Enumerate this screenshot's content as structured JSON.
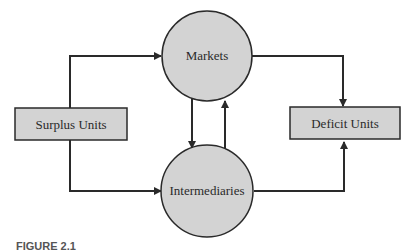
{
  "diagram": {
    "nodes": [
      {
        "id": "surplus",
        "label": "Surplus Units",
        "shape": "rectangle"
      },
      {
        "id": "markets",
        "label": "Markets",
        "shape": "circle"
      },
      {
        "id": "intermediaries",
        "label": "Intermediaries",
        "shape": "circle"
      },
      {
        "id": "deficit",
        "label": "Deficit Units",
        "shape": "rectangle"
      }
    ],
    "edges": [
      {
        "from": "surplus",
        "to": "markets"
      },
      {
        "from": "surplus",
        "to": "intermediaries"
      },
      {
        "from": "markets",
        "to": "intermediaries"
      },
      {
        "from": "intermediaries",
        "to": "markets"
      },
      {
        "from": "markets",
        "to": "deficit"
      },
      {
        "from": "intermediaries",
        "to": "deficit"
      }
    ],
    "caption": "FIGURE 2.1",
    "colors": {
      "fill": "#d3d3d3",
      "stroke": "#2a2a2a"
    }
  }
}
